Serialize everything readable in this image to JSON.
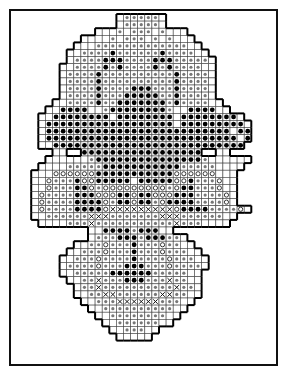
{
  "chart_title": "Plastic canvas stitch chart",
  "grid": {
    "origin_x": 17,
    "origin_y": 14,
    "cell": 7.1,
    "legend_symbols": {
      "#": "filled-dot",
      "o": "open-circle",
      "x": "cross",
      "+": "gray-dot",
      ".": "empty-cell",
      " ": "outside"
    },
    "rows": [
      "              .+++++.              ",
      "              .+++++.              ",
      "           ...+.+++.+...           ",
      "         ....+.+++.+.+...         ",
      "        ...+++++++++++++..        ",
      "       ..++++#++++++#++++..       ",
      "       .++++###++++###+++++.      ",
      "      ..++++#+#++++#+#++++..      ",
      "      .++++#++++++++++#++++.      ",
      "      .++++#++++++++++#++++.      ",
      "      .++++#++++###+++#++++.      ",
      "      .++++#+++#####++#++++.      ",
      "     ..++++#++#######+#++++..     ",
      "    ..####..+########+..####..    ",
      "   ..########.########.########.  ",
      "   .##################.#########. ",
      "   .##########################.## ",
      "   .###########################.# ",
      "   ..########################### ",
      "     ..  #################  ..   ",
      "    ......+###############+......",
      "   ....+++++###########+++++.... ",
      "  ...oooooo###########oooooo...  ",
      "  ..o+++#oo#####.#####oo#+++o..  ",
      "  ..o+++##o+ooooooooo+o##+++o..  ",
      "  .o++++###ooo##o##ooo###++++o.  ",
      "  .o++++####o+##o##+o####++++o.  ",
      "  .o++++####oxxxxxxxxxo####++++o.",
      "  ..++++++xxx+++++++xxx++++++..  ",
      "   ....+++x+++++++++++x+++....   ",
      "          ..####+###..           ",
      "          .+++###+###++.         ",
      "        ..++o+++#+++o++..        ",
      "       ..+++o+++#+++o+++..       ",
      "      ..+++o++++#++++o+++..      ",
      "      .++++o+++###+++o++++.      ",
      "      ..+++++######+++++..       ",
      "       ..++x+++###+++x++..       ",
      "        .++x++++++++++x++.       ",
      "        ..++xx++++++xx++..       ",
      "         ..+++xxxxxx+++..        ",
      "          ..++++++++++..         ",
      "           ..++++++++..          ",
      "            ..++++++..           ",
      "             ..+++..             ",
      "              .....              "
    ]
  }
}
